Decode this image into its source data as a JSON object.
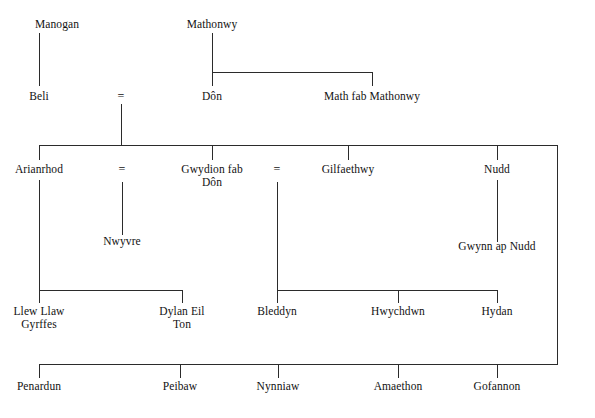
{
  "diagram": {
    "type": "genealogy-tree",
    "background_color": "#ffffff",
    "line_color": "#2b2b2b",
    "text_color": "#121212",
    "marriage_symbol": "="
  },
  "people": {
    "manogan": "Manogan",
    "mathonwy": "Mathonwy",
    "beli": "Beli",
    "don": "Dôn",
    "math_fab_mathonwy": "Math fab Mathonwy",
    "arianrhod": "Arianrhod",
    "gwydion_fab_don": "Gwydion fab\nDôn",
    "gilfaethwy": "Gilfaethwy",
    "nudd": "Nudd",
    "nwyvre": "Nwyvre",
    "gwynn_ap_nudd": "Gwynn ap Nudd",
    "llew_llaw_gyrffes": "Llew Llaw\nGyrffes",
    "dylan_eil_ton": "Dylan Eil\nTon",
    "bleddyn": "Bleddyn",
    "hwychdwn": "Hwychdwn",
    "hydan": "Hydan",
    "penardun": "Penardun",
    "peibaw": "Peibaw",
    "nynniaw": "Nynniaw",
    "amaethon": "Amaethon",
    "gofannon": "Gofannon"
  },
  "marriages": {
    "beli_don": "=",
    "arianrhod_gwydion": "=",
    "gwydion_gilfaethwy": "="
  }
}
